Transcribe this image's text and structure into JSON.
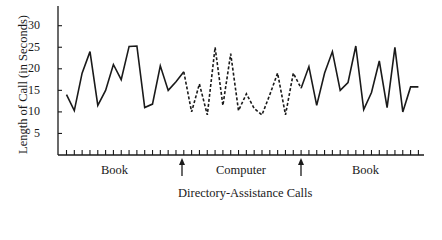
{
  "chart_data": {
    "type": "line",
    "title": "",
    "xlabel": "Directory-Assistance Calls",
    "ylabel": "Length of Call (in Seconds)",
    "ylim": [
      0,
      35
    ],
    "yticks": [
      5,
      10,
      15,
      20,
      25,
      30
    ],
    "grid": false,
    "legend": "none",
    "x_segment_labels": [
      {
        "label": "Book",
        "range": [
          1,
          16
        ]
      },
      {
        "label": "Computer",
        "range": [
          16,
          31
        ]
      },
      {
        "label": "Book",
        "range": [
          31,
          46
        ]
      }
    ],
    "annotations": [
      "arrow at change from Book to Computer",
      "arrow at change from Computer to Book"
    ],
    "series": [
      {
        "name": "Book (before)",
        "style": "solid",
        "x": [
          1,
          2,
          3,
          4,
          5,
          6,
          7,
          8,
          9,
          10,
          11,
          12,
          13,
          14,
          15,
          16
        ],
        "values": [
          14,
          10.3,
          19,
          24,
          11.5,
          15,
          21,
          17.5,
          25.2,
          25.3,
          11,
          11.8,
          20.7,
          15,
          17,
          19.3
        ]
      },
      {
        "name": "Computer",
        "style": "dashed",
        "x": [
          16,
          17,
          18,
          19,
          20,
          21,
          22,
          23,
          24,
          25,
          26,
          27,
          28,
          29,
          30,
          31
        ],
        "values": [
          19.3,
          10,
          16.5,
          9.3,
          25,
          11.5,
          23.5,
          10.3,
          14.2,
          10.8,
          9.3,
          14,
          19,
          9.3,
          19,
          15.5
        ]
      },
      {
        "name": "Book (after)",
        "style": "solid",
        "x": [
          31,
          32,
          33,
          34,
          35,
          36,
          37,
          38,
          39,
          40,
          41,
          42,
          43,
          44,
          45,
          46
        ],
        "values": [
          15.5,
          20.5,
          11.5,
          19,
          24,
          15,
          16.8,
          25.3,
          10.5,
          14.5,
          21.8,
          11,
          25,
          10,
          15.8,
          15.8
        ]
      }
    ]
  },
  "labels": {
    "ylabel": "Length of Call (in Seconds)",
    "xlabel": "Directory-Assistance Calls",
    "seg1": "Book",
    "seg2": "Computer",
    "seg3": "Book",
    "y5": "5",
    "y10": "10",
    "y15": "15",
    "y20": "20",
    "y25": "25",
    "y30": "30"
  }
}
